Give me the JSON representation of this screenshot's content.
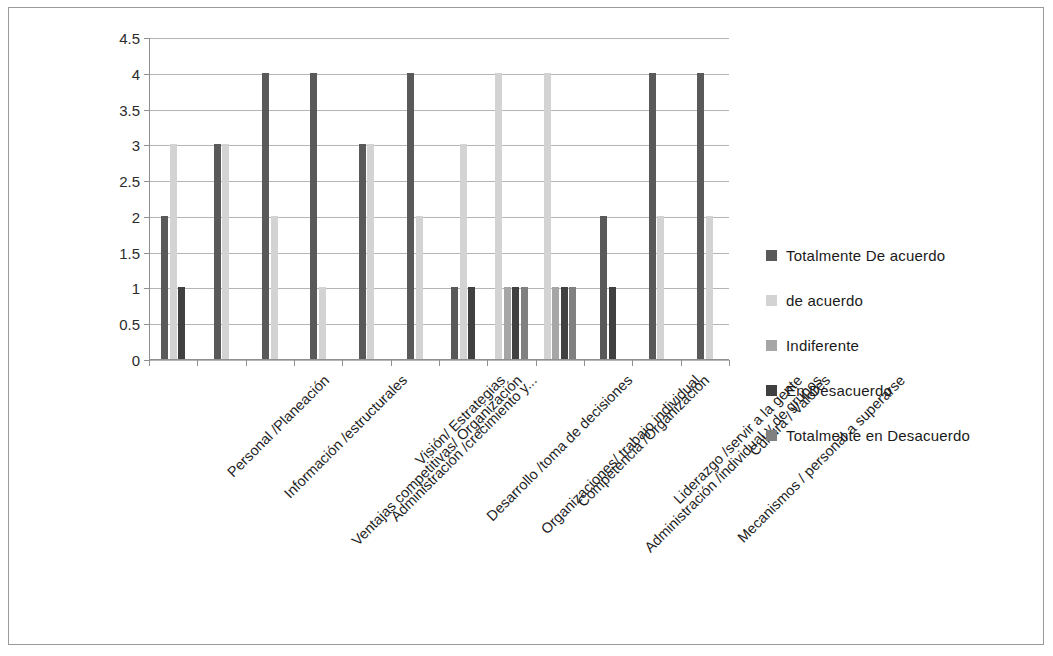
{
  "chart_data": {
    "type": "bar",
    "title": "",
    "subtitle": "",
    "xlabel": "",
    "ylabel": "",
    "ylim": [
      0,
      4.5
    ],
    "grid": true,
    "legend_position": "right",
    "ytick_labels": [
      "4.5",
      "4",
      "3.5",
      "3",
      "2.5",
      "2",
      "1.5",
      "1",
      "0.5",
      "0"
    ],
    "ytick_values": [
      4.5,
      4,
      3.5,
      3,
      2.5,
      2,
      1.5,
      1,
      0.5,
      0
    ],
    "categories": [
      "Personal /Planeación",
      "Información /estructurales",
      "Ventajas competitivas/ Organización",
      "Administración /crecimiento y...",
      "Visión/ Estrategias",
      "Desarrollo /toma de decisiones",
      "Organizaciones/ trabajo individual",
      "Competencia /Organización",
      "Administración /individual y de grupos",
      "Liderazgo /servir a la gente",
      "Mecanismos / personal a superarse",
      "Cultura / Valores"
    ],
    "series": [
      {
        "name": "Totalmente De acuerdo",
        "color": "#595959",
        "values": [
          2,
          3,
          4,
          4,
          3,
          4,
          1,
          0,
          0,
          2,
          4,
          4
        ]
      },
      {
        "name": "de acuerdo",
        "color": "#d3d3d3",
        "values": [
          3,
          3,
          2,
          1,
          3,
          2,
          3,
          4,
          4,
          0,
          2,
          2
        ]
      },
      {
        "name": "Indiferente",
        "color": "#a6a6a6",
        "values": [
          0,
          0,
          0,
          0,
          0,
          0,
          0,
          1,
          1,
          0,
          0,
          0
        ]
      },
      {
        "name": "En Desacuerdo",
        "color": "#404040",
        "values": [
          1,
          0,
          0,
          0,
          0,
          0,
          1,
          1,
          1,
          1,
          0,
          0
        ]
      },
      {
        "name": "Totalmente en Desacuerdo",
        "color": "#808080",
        "values": [
          0,
          0,
          0,
          0,
          0,
          0,
          0,
          1,
          1,
          0,
          0,
          0
        ]
      }
    ]
  },
  "legend": {
    "items": [
      {
        "label": "Totalmente De acuerdo",
        "color": "#595959"
      },
      {
        "label": " de acuerdo",
        "color": "#d3d3d3"
      },
      {
        "label": "Indiferente",
        "color": "#a6a6a6"
      },
      {
        "label": "En Desacuerdo",
        "color": "#404040"
      },
      {
        "label": "Totalmente en Desacuerdo",
        "color": "#808080"
      }
    ]
  }
}
